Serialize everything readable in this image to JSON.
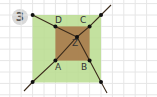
{
  "exercise_number": "3",
  "colors": {
    "grid": "#e3e3e3",
    "outer_square_fill": "#b7dc8c",
    "inner_square_fill": "#a87b4e",
    "line": "#3a2a1a",
    "point": "#111111",
    "badge_bg": "#d9d9d9"
  },
  "points": {
    "A": {
      "label": "A",
      "x": 55,
      "y": 60
    },
    "B": {
      "label": "B",
      "x": 89,
      "y": 60
    },
    "C": {
      "label": "C",
      "x": 89,
      "y": 26
    },
    "D": {
      "label": "D",
      "x": 55,
      "y": 26
    },
    "Z": {
      "label": "Z",
      "x": 77,
      "y": 37
    }
  },
  "labels": {
    "A": "A",
    "B": "B",
    "C": "C",
    "D": "D",
    "Z": "Z"
  }
}
